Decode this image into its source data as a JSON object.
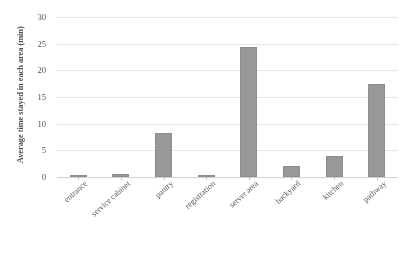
{
  "chart_data": {
    "type": "bar",
    "title": "",
    "subtitle": "",
    "xlabel": "",
    "ylabel": "Average time stayed in each area (min)",
    "categories": [
      "entrance",
      "service cabinet",
      "pantry",
      "registration",
      "server area",
      "backyard",
      "kitchen",
      "pathway"
    ],
    "values": [
      0.3,
      0.6,
      8.3,
      0.4,
      24.3,
      2.0,
      4.0,
      17.5
    ],
    "ylim": [
      0,
      30
    ],
    "yticks": [
      0,
      5,
      10,
      15,
      20,
      25,
      30
    ],
    "ytick_labels": [
      "0",
      "5",
      "10",
      "15",
      "20",
      "25",
      "30"
    ],
    "grid": true,
    "legend": false,
    "legend_position": "none",
    "bar_color": "#9a9a9a",
    "gridline_color": "#ededed",
    "axis_color": "#d8d8d8",
    "text_color": "#4f4f4f"
  }
}
